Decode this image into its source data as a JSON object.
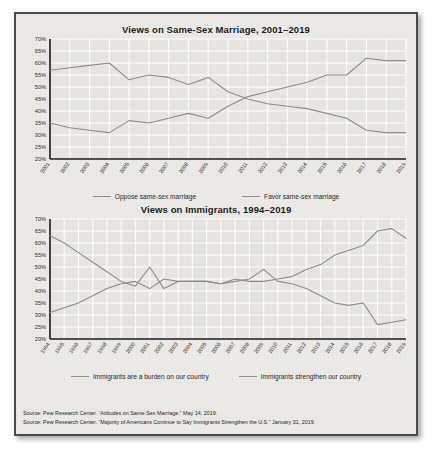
{
  "document": {
    "background_color": "#eceae6",
    "border_color": "#4c4a48"
  },
  "charts": [
    {
      "id": "same-sex-marriage",
      "title": "Views on Same-Sex Marriage, 2001–2019",
      "legend": [
        {
          "label": "Oppose same-sex marriage",
          "color": "#8d8d8d"
        },
        {
          "label": "Favor same-sex marriage",
          "color": "#8d8d8d"
        }
      ]
    },
    {
      "id": "immigrants",
      "title": "Views on Immigrants, 1994–2019",
      "legend": [
        {
          "label": "Immigrants are a burden on our country",
          "color": "#8d8d8d"
        },
        {
          "label": "Immigrants strengthen our country",
          "color": "#8d8d8d"
        }
      ]
    }
  ],
  "sources": [
    "Source: Pew Research Center. “Attitudes on Same-Sex Marriage.” May 14, 2019.",
    "Source: Pew Research Center. “Majority of Americans Continue to Say Immigrants Strengthen the U.S.” January 31, 2019."
  ],
  "chart_data": [
    {
      "type": "line",
      "id": "same-sex-marriage",
      "title": "Views on Same-Sex Marriage, 2001–2019",
      "xlabel": "",
      "ylabel": "",
      "grid": true,
      "legend_position": "bottom",
      "ylim": [
        20,
        70
      ],
      "yticks": [
        20,
        25,
        30,
        35,
        40,
        45,
        50,
        55,
        60,
        65,
        70
      ],
      "ytick_labels": [
        "20%",
        "25%",
        "30%",
        "35%",
        "40%",
        "45%",
        "50%",
        "55%",
        "60%",
        "65%",
        "70%"
      ],
      "categories": [
        2001,
        2002,
        2003,
        2004,
        2005,
        2006,
        2007,
        2008,
        2009,
        2010,
        2011,
        2012,
        2013,
        2014,
        2015,
        2016,
        2017,
        2018,
        2019
      ],
      "xtick_labels": [
        "2001",
        "2002",
        "2003",
        "2004",
        "2005",
        "2006",
        "2007",
        "2008",
        "2009",
        "2010",
        "2011",
        "2012",
        "2013",
        "2014",
        "2015",
        "2016",
        "2017",
        "2018",
        "2019"
      ],
      "series": [
        {
          "name": "Oppose same-sex marriage",
          "color": "#8d8d8d",
          "values": [
            57,
            58,
            59,
            60,
            53,
            55,
            54,
            51,
            54,
            48,
            45,
            43,
            42,
            41,
            39,
            37,
            32,
            31,
            31
          ]
        },
        {
          "name": "Favor same-sex marriage",
          "color": "#8d8d8d",
          "values": [
            35,
            33,
            32,
            31,
            36,
            35,
            37,
            39,
            37,
            42,
            46,
            48,
            50,
            52,
            55,
            55,
            62,
            61,
            61
          ]
        }
      ]
    },
    {
      "type": "line",
      "id": "immigrants",
      "title": "Views on Immigrants, 1994–2019",
      "xlabel": "",
      "ylabel": "",
      "grid": true,
      "legend_position": "bottom",
      "ylim": [
        20,
        70
      ],
      "yticks": [
        20,
        25,
        30,
        35,
        40,
        45,
        50,
        55,
        60,
        65,
        70
      ],
      "ytick_labels": [
        "20%",
        "25%",
        "30%",
        "35%",
        "40%",
        "45%",
        "50%",
        "55%",
        "60%",
        "65%",
        "70%"
      ],
      "categories": [
        1994,
        1995,
        1996,
        1997,
        1998,
        1999,
        2000,
        2001,
        2002,
        2003,
        2004,
        2005,
        2006,
        2007,
        2008,
        2009,
        2010,
        2011,
        2012,
        2013,
        2014,
        2015,
        2016,
        2017,
        2018,
        2019
      ],
      "xtick_labels": [
        "1994",
        "1995",
        "1996",
        "1997",
        "1998",
        "1999",
        "2000",
        "2001",
        "2002",
        "2003",
        "2004",
        "2005",
        "2006",
        "2007",
        "2008",
        "2009",
        "2010",
        "2011",
        "2012",
        "2013",
        "2014",
        "2015",
        "2016",
        "2017",
        "2018",
        "2019"
      ],
      "series": [
        {
          "name": "Immigrants are a burden on our country",
          "color": "#8d8d8d",
          "values": [
            63,
            60,
            56,
            52,
            48,
            44,
            42,
            50,
            41,
            44,
            44,
            44,
            43,
            44,
            45,
            49,
            44,
            43,
            41,
            38,
            35,
            34,
            35,
            26,
            27,
            28
          ]
        },
        {
          "name": "Immigrants strengthen our country",
          "color": "#8d8d8d",
          "values": [
            31,
            33,
            35,
            38,
            41,
            43,
            44,
            41,
            45,
            44,
            44,
            44,
            43,
            45,
            44,
            44,
            45,
            46,
            49,
            51,
            55,
            57,
            59,
            65,
            66,
            62
          ]
        }
      ]
    }
  ]
}
